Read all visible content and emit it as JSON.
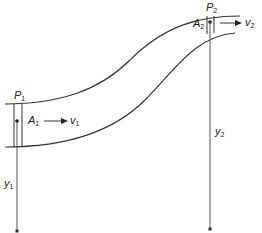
{
  "diagram": {
    "type": "bernoulli-pipe-flow",
    "labels": {
      "p1": {
        "base": "P",
        "sub": "1"
      },
      "a1": {
        "base": "A",
        "sub": "1"
      },
      "v1": {
        "base": "v",
        "sub": "1"
      },
      "y1": {
        "base": "y",
        "sub": "1"
      },
      "p2": {
        "base": "P",
        "sub": "2"
      },
      "a2": {
        "base": "A",
        "sub": "2"
      },
      "v2": {
        "base": "v",
        "sub": "2"
      },
      "y2": {
        "base": "y",
        "sub": "2"
      }
    },
    "colors": {
      "stroke": "#333333",
      "background": "#ffffff"
    }
  }
}
